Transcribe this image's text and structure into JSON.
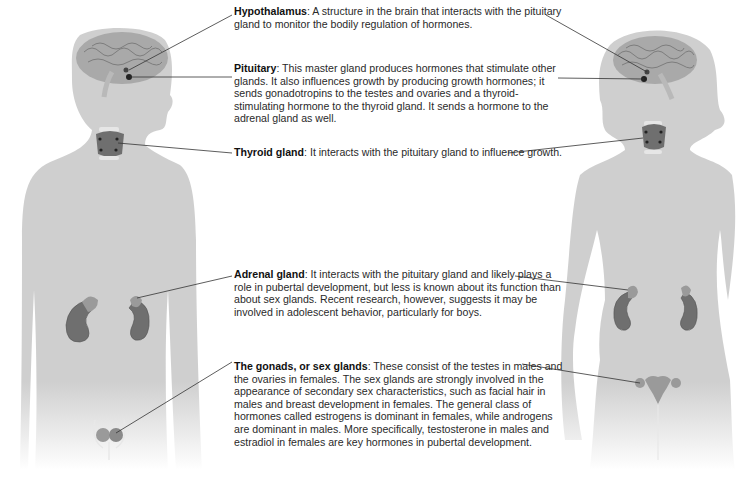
{
  "diagram": {
    "colors": {
      "silhouette": "#cfcfcf",
      "brain": "#a9a9a9",
      "gland_dark": "#6f6f6f",
      "gland_light": "#9a9a9a",
      "leader_line": "#333333",
      "text": "#222222"
    },
    "figures": [
      {
        "name": "male",
        "label": "Male body silhouette"
      },
      {
        "name": "female",
        "label": "Female body silhouette"
      }
    ],
    "callouts": [
      {
        "term": "Hypothalamus",
        "separator": ": ",
        "text": "A structure in the brain that interacts with the pituitary gland to monitor the bodily regulation of hormones."
      },
      {
        "term": "Pituitary",
        "separator": ": ",
        "text": "This master gland produces hormones that stimulate other glands. It also influences growth by producing growth hormones; it sends gonadotropins to the testes and ovaries and a thyroid-stimulating hormone to the thyroid gland. It sends a hormone to the adrenal gland as well."
      },
      {
        "term": "Thyroid gland",
        "separator": ": ",
        "text": "It interacts with the pituitary gland to influence growth."
      },
      {
        "term": "Adrenal gland",
        "separator": ": ",
        "text": "It interacts with the pituitary gland and likely plays a role in pubertal development, but less is known about its function than about sex glands. Recent research, however, suggests it may be involved in adolescent behavior, particularly for boys."
      },
      {
        "term": "The gonads, or sex glands",
        "separator": ": ",
        "text": "These consist of the testes in males and the ovaries in females. The sex glands are strongly involved in the appearance of secondary sex characteristics, such as facial hair in males and breast development in females. The general class of hormones called estrogens is dominant in females, while androgens are dominant in males. More specifically, testosterone in males and estradiol in females are key hormones in pubertal development."
      }
    ]
  }
}
